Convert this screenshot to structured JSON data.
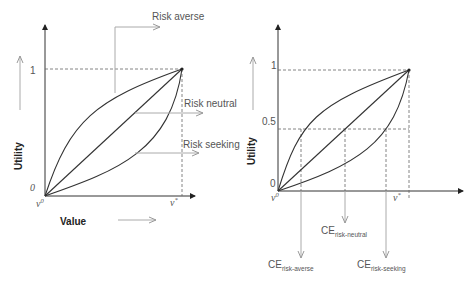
{
  "left_chart": {
    "y_axis_label": "Utility",
    "x_axis_label": "Value",
    "y_ticks": [
      "1",
      "0"
    ],
    "x_ticks": [
      "v0",
      "v*"
    ],
    "x_tick_v0_base": "v",
    "x_tick_v0_sup": "0",
    "x_tick_vstar_base": "v",
    "x_tick_vstar_sup": "*",
    "curves": [
      {
        "name": "Risk averse",
        "shape": "concave"
      },
      {
        "name": "Risk neutral",
        "shape": "linear"
      },
      {
        "name": "Risk seeking",
        "shape": "convex"
      }
    ],
    "annotations": {
      "risk_averse": "Risk averse",
      "risk_neutral": "Risk neutral",
      "risk_seeking": "Risk seeking"
    }
  },
  "right_chart": {
    "y_axis_label": "Utility",
    "y_ticks": [
      "1",
      "0.5",
      "0"
    ],
    "x_tick_v0_base": "v",
    "x_tick_v0_sup": "0",
    "x_tick_vstar_base": "v",
    "x_tick_vstar_sup": "*",
    "certainty_equivalents": {
      "ce_base": "CE",
      "risk_averse_sub": "risk-averse",
      "risk_neutral_sub": "risk-neutral",
      "risk_seeking_sub": "risk-seeking"
    }
  },
  "colors": {
    "curve": "#333333",
    "axis": "#333333",
    "annotation_arrow": "#aaaaaa",
    "dashed": "#666666",
    "text": "#555555"
  }
}
